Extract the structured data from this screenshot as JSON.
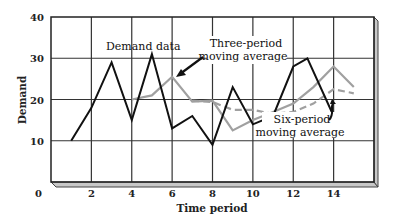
{
  "chart_data": {
    "type": "line",
    "title": "",
    "xlabel": "Time period",
    "ylabel": "Demand",
    "xlim": [
      0,
      16
    ],
    "ylim": [
      0,
      40
    ],
    "x_ticks": [
      2,
      4,
      6,
      8,
      10,
      12,
      14
    ],
    "y_ticks": [
      0,
      10,
      20,
      30,
      40
    ],
    "grid": true,
    "legend_position": "inline annotations",
    "series": [
      {
        "name": "Demand data",
        "style": "solid",
        "color": "#111111",
        "x": [
          1,
          2,
          3,
          4,
          5,
          6,
          7,
          8,
          9,
          10,
          11,
          12,
          12.7,
          14
        ],
        "values": [
          10,
          18,
          29,
          15,
          31,
          13,
          16,
          9,
          23,
          14,
          16,
          28,
          30,
          16
        ]
      },
      {
        "name": "Three-period moving average",
        "style": "solid",
        "color": "#a0a0a0",
        "x": [
          4,
          5,
          6,
          7,
          8,
          9,
          10,
          11,
          12,
          13,
          14,
          15
        ],
        "values": [
          20,
          21,
          25.5,
          19.5,
          19.7,
          12.5,
          15,
          17,
          19,
          23,
          28,
          23
        ]
      },
      {
        "name": "Six-period moving average",
        "style": "dashed",
        "color": "#a0a0a0",
        "x": [
          7,
          8,
          9,
          10,
          11,
          12,
          13,
          14,
          15
        ],
        "values": [
          19.7,
          19.4,
          17.5,
          17.5,
          16.5,
          17,
          19,
          22.5,
          21.5
        ]
      }
    ],
    "annotations": [
      {
        "text": "Demand data",
        "points_to": "Demand data"
      },
      {
        "text": [
          "Three-period",
          "moving average"
        ],
        "points_to": "Three-period moving average"
      },
      {
        "text": [
          "Six-period",
          "moving average"
        ],
        "points_to": "Six-period moving average"
      }
    ]
  }
}
